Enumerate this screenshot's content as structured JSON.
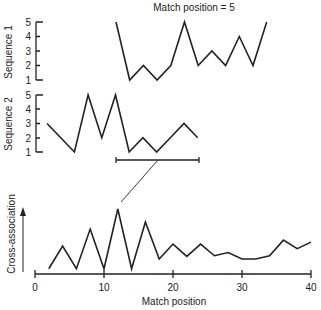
{
  "title": "Match position = 5",
  "sequence1": {
    "label": "Sequence 1",
    "ticks": [
      "1",
      "2",
      "3",
      "4",
      "5"
    ],
    "values": [
      5,
      1,
      2,
      1,
      2,
      5,
      2,
      3,
      2,
      4,
      2,
      5
    ]
  },
  "sequence2": {
    "label": "Sequence 2",
    "ticks": [
      "1",
      "2",
      "3",
      "4",
      "5"
    ],
    "values": [
      3,
      2,
      1,
      5,
      2,
      5,
      1,
      2,
      1,
      2,
      3,
      2
    ]
  },
  "cross": {
    "ylabel": "Cross-association",
    "xlabel": "Match position",
    "xticks": [
      "0",
      "10",
      "20",
      "30",
      "40"
    ]
  },
  "chart_data": [
    {
      "type": "line",
      "title": "Match position = 5",
      "ylabel": "Sequence 1",
      "ylim": [
        1,
        5
      ],
      "x": [
        1,
        2,
        3,
        4,
        5,
        6,
        7,
        8,
        9,
        10,
        11,
        12
      ],
      "values": [
        5,
        1,
        2,
        1,
        2,
        5,
        2,
        3,
        2,
        4,
        2,
        5
      ]
    },
    {
      "type": "line",
      "ylabel": "Sequence 2",
      "ylim": [
        1,
        5
      ],
      "x": [
        1,
        2,
        3,
        4,
        5,
        6,
        7,
        8,
        9,
        10,
        11,
        12
      ],
      "values": [
        3,
        2,
        1,
        5,
        2,
        5,
        1,
        2,
        1,
        2,
        3,
        2
      ]
    },
    {
      "type": "line",
      "xlabel": "Match position",
      "ylabel": "Cross-association",
      "xlim": [
        0,
        40
      ],
      "x": [
        2,
        4,
        6,
        8,
        10,
        12,
        14,
        16,
        18,
        20,
        22,
        24,
        26,
        28,
        30,
        32,
        34,
        36,
        38,
        40
      ],
      "values": [
        0.05,
        0.4,
        0.05,
        0.66,
        0.05,
        0.97,
        0.05,
        0.77,
        0.2,
        0.43,
        0.24,
        0.43,
        0.25,
        0.3,
        0.2,
        0.2,
        0.25,
        0.49,
        0.36,
        0.46
      ]
    }
  ]
}
